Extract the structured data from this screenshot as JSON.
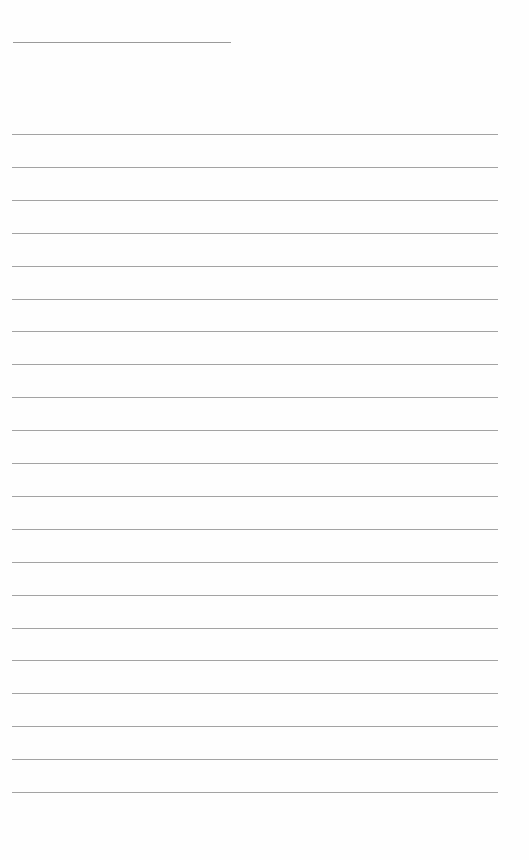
{
  "document": {
    "type": "blank lined writing sheet",
    "header_line": {
      "x": 13,
      "y": 42,
      "width": 218
    },
    "ruled_lines": {
      "count": 21,
      "first_y": 134,
      "spacing": 32.9,
      "x": 12,
      "width": 486,
      "color": "#a3a3a3"
    },
    "text": ""
  }
}
